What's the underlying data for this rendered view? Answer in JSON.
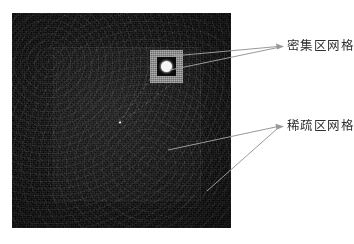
{
  "figure": {
    "type": "annotated-image",
    "background_color": "#ffffff",
    "image_panel": {
      "description": "dark noisy grayscale grid image",
      "base_color": "#0d0d0d"
    },
    "regions": {
      "dense": {
        "name": "dense-grid-region",
        "frame_color": "#8d8d8d",
        "core_color": "#080808",
        "marker_color": "#f6f6f6"
      },
      "sparse": {
        "name": "sparse-grid-region",
        "tint_color": "#1a1a1a"
      }
    }
  },
  "annotations": {
    "dense_label": "密集区网格",
    "sparse_label": "稀疏区网格",
    "leader_color": "#9a9a9a",
    "text_color": "#2e2e2e"
  }
}
